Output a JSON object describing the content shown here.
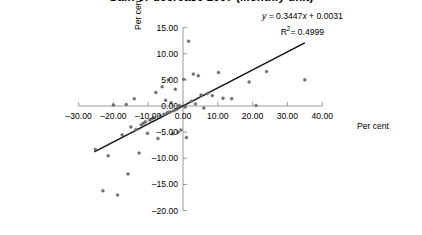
{
  "chart_data": {
    "type": "scatter",
    "title": "Gain or decrease 2007 (Monthly unit)",
    "title_clipped": true,
    "xlabel": "Per cent",
    "ylabel": "Per cent",
    "xlim": [
      -30,
      40
    ],
    "ylim": [
      -20,
      15
    ],
    "xticks": [
      -30,
      -20,
      -10,
      0,
      10,
      20,
      30,
      40
    ],
    "xticklabels": [
      "–30.00",
      "–20.00",
      "–10.00",
      "0.00",
      "10.00",
      "20.00",
      "30.00",
      "40.00"
    ],
    "yticks": [
      15,
      10,
      5,
      0,
      -5,
      -10,
      -15,
      -20
    ],
    "yticklabels": [
      "15.00",
      "10.00",
      "5.00",
      "0.00",
      "–5.00",
      "–10.00",
      "–15.00",
      "–20.00"
    ],
    "grid": false,
    "legend": null,
    "marker_color": "#6e6e6e",
    "trendline_color": "#111111",
    "annotations": {
      "equation": "y = 0.3447x + 0.0031",
      "equation_y": "y",
      "equation_rest": " = 0.3447",
      "equation_x": "x",
      "equation_tail": " + 0.0031",
      "r_squared_label": "R",
      "r_squared_exp": "2",
      "r_squared_value": "= 0.4999"
    },
    "trendline": {
      "slope": 0.3447,
      "intercept": 0.0031,
      "x_start": -25.5,
      "x_end": 35.0
    },
    "points": [
      {
        "x": -25.2,
        "y": -8.3
      },
      {
        "x": -23.0,
        "y": -16.2
      },
      {
        "x": -21.5,
        "y": -9.5
      },
      {
        "x": -20.0,
        "y": 0.2
      },
      {
        "x": -18.8,
        "y": -17.0
      },
      {
        "x": -17.5,
        "y": -5.5
      },
      {
        "x": -16.3,
        "y": 0.3
      },
      {
        "x": -15.8,
        "y": -13.0
      },
      {
        "x": -15.0,
        "y": -4.0
      },
      {
        "x": -14.0,
        "y": 1.4
      },
      {
        "x": -13.5,
        "y": -4.5
      },
      {
        "x": -12.6,
        "y": -9.0
      },
      {
        "x": -12.0,
        "y": -3.6
      },
      {
        "x": -11.4,
        "y": -3.3
      },
      {
        "x": -10.8,
        "y": -3.0
      },
      {
        "x": -10.2,
        "y": -5.2
      },
      {
        "x": -9.6,
        "y": -2.7
      },
      {
        "x": -9.0,
        "y": -2.5
      },
      {
        "x": -8.4,
        "y": -2.2
      },
      {
        "x": -7.8,
        "y": 2.6
      },
      {
        "x": -7.2,
        "y": -6.2
      },
      {
        "x": -6.6,
        "y": -1.9
      },
      {
        "x": -6.0,
        "y": 3.7
      },
      {
        "x": -5.5,
        "y": -1.6
      },
      {
        "x": -5.0,
        "y": 1.1
      },
      {
        "x": -4.6,
        "y": -1.3
      },
      {
        "x": -4.2,
        "y": 5.0
      },
      {
        "x": -3.8,
        "y": -1.1
      },
      {
        "x": -3.4,
        "y": 0.6
      },
      {
        "x": -3.0,
        "y": -5.3
      },
      {
        "x": -2.6,
        "y": -0.9
      },
      {
        "x": -2.2,
        "y": 3.2
      },
      {
        "x": -1.8,
        "y": -0.6
      },
      {
        "x": -1.4,
        "y": -5.0
      },
      {
        "x": -1.0,
        "y": 0.1
      },
      {
        "x": -0.6,
        "y": -4.6
      },
      {
        "x": 0.2,
        "y": 5.1
      },
      {
        "x": 0.6,
        "y": -0.2
      },
      {
        "x": 1.0,
        "y": -6.0
      },
      {
        "x": 1.6,
        "y": 12.4
      },
      {
        "x": 2.4,
        "y": 0.9
      },
      {
        "x": 3.0,
        "y": 6.1
      },
      {
        "x": 3.6,
        "y": 0.4
      },
      {
        "x": 4.4,
        "y": 5.8
      },
      {
        "x": 5.2,
        "y": 2.1
      },
      {
        "x": 6.0,
        "y": -0.4
      },
      {
        "x": 7.0,
        "y": 2.4
      },
      {
        "x": 8.4,
        "y": 2.0
      },
      {
        "x": 10.2,
        "y": 6.4
      },
      {
        "x": 11.5,
        "y": 1.5
      },
      {
        "x": 14.0,
        "y": 1.4
      },
      {
        "x": 19.0,
        "y": 4.6
      },
      {
        "x": 21.0,
        "y": 0.1
      },
      {
        "x": 24.0,
        "y": 6.6
      },
      {
        "x": 35.0,
        "y": 5.0
      }
    ]
  }
}
